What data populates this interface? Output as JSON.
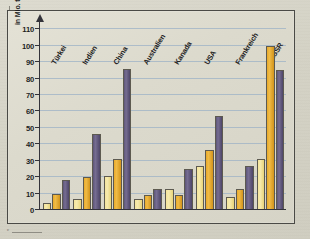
{
  "page": {
    "corner_mark_top": "",
    "corner_mark_bottom": "c"
  },
  "chart_data": {
    "type": "bar",
    "title": "",
    "subtitle": "",
    "xlabel": "",
    "ylabel": "in Mio. t",
    "ylim": [
      0,
      115
    ],
    "yticks": [
      0,
      10,
      20,
      30,
      40,
      50,
      60,
      70,
      80,
      90,
      100,
      110
    ],
    "ytick_labels": [
      "0",
      "10",
      "20",
      "30",
      "40",
      "50",
      "60",
      "70",
      "80",
      "90",
      "100",
      "110"
    ],
    "grid": true,
    "grid_axis": "y",
    "legend": false,
    "legend_position": "none",
    "categories": [
      "Türkei",
      "Indien",
      "China",
      "Australien",
      "Kanada",
      "USA",
      "Frankreich",
      "UdSSR"
    ],
    "series": [
      {
        "name": "Serie 1",
        "color": "#f2e29a",
        "values": [
          4,
          7,
          21,
          7,
          13,
          27,
          8,
          31
        ]
      },
      {
        "name": "Serie 2",
        "color": "#e8a92a",
        "values": [
          10,
          20,
          31,
          9,
          9,
          36.5,
          13,
          100
        ]
      },
      {
        "name": "Serie 3",
        "color": "#5d5578",
        "values": [
          18,
          46,
          86,
          12.5,
          25,
          57.5,
          26.5,
          85
        ]
      }
    ],
    "colors": {
      "series1": "#f2e29a",
      "series2": "#e8a92a",
      "series3": "#5d5578",
      "gridline": "#9fb3c6",
      "axis": "#33333a",
      "background": "#dcdacd",
      "frame": "#4a4a46"
    }
  }
}
